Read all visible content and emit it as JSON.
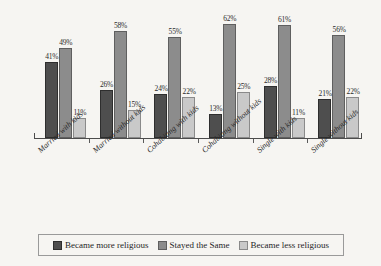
{
  "chart_data": {
    "type": "bar",
    "title": "",
    "subtitle": "",
    "xlabel": "",
    "ylabel": "",
    "ylim": [
      0,
      70
    ],
    "grid": false,
    "legend_position": "bottom",
    "value_suffix": "%",
    "categories": [
      "Married with kids",
      "Married without kids",
      "Cohabiting with kids",
      "Cohabiting without kids",
      "Single with kids",
      "Single without kids"
    ],
    "series": [
      {
        "name": "Became more religious",
        "color": "#4e4e4e",
        "values": [
          41,
          26,
          24,
          13,
          28,
          21
        ],
        "labels": [
          "41%",
          "26%",
          "24%",
          "13%",
          "28%",
          "21%"
        ]
      },
      {
        "name": "Stayed the Same",
        "color": "#8c8c8c",
        "values": [
          49,
          58,
          55,
          62,
          61,
          56
        ],
        "labels": [
          "49%",
          "58%",
          "55%",
          "62%",
          "61%",
          "56%"
        ]
      },
      {
        "name": "Became less religious",
        "color": "#c9c9c9",
        "values": [
          11,
          15,
          22,
          25,
          11,
          22
        ],
        "labels": [
          "11%",
          "15%",
          "22%",
          "25%",
          "11%",
          "22%"
        ]
      }
    ]
  },
  "legend": {
    "items": [
      {
        "label": "Became more religious"
      },
      {
        "label": "Stayed the Same"
      },
      {
        "label": "Became less religious"
      }
    ]
  },
  "colors": {
    "background": "#f6f5f2",
    "axis": "#4c4c4c",
    "series_more": "#4e4e4e",
    "series_same": "#8c8c8c",
    "series_less": "#c9c9c9",
    "text": "#1f1f1f"
  }
}
